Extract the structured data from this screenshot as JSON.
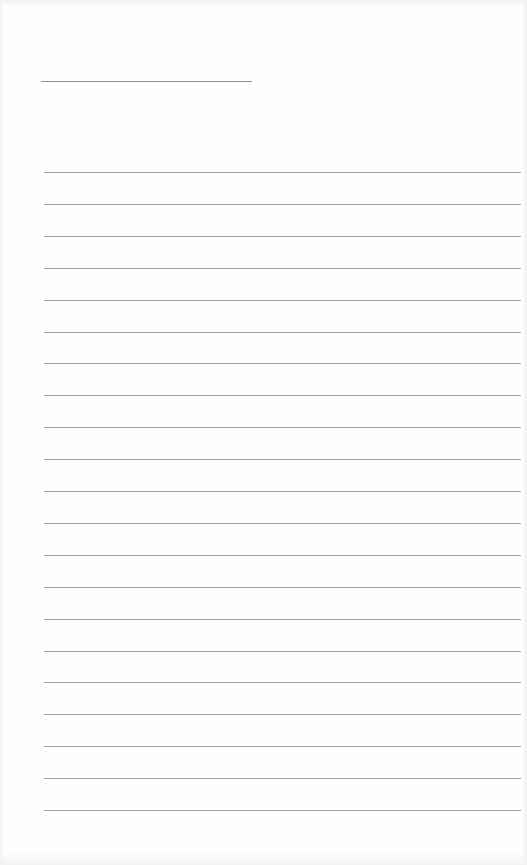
{
  "document": {
    "type": "lined-writing-sheet",
    "name_field": {
      "text": ""
    },
    "ruled_lines": {
      "count": 21,
      "first_line_y": 172,
      "spacing_px": 31.9,
      "color": "#a3a3a3",
      "texts": [
        "",
        "",
        "",
        "",
        "",
        "",
        "",
        "",
        "",
        "",
        "",
        "",
        "",
        "",
        "",
        "",
        "",
        "",
        "",
        "",
        ""
      ]
    },
    "name_line_color": "#8f8f8f",
    "background": "#fefefe"
  }
}
